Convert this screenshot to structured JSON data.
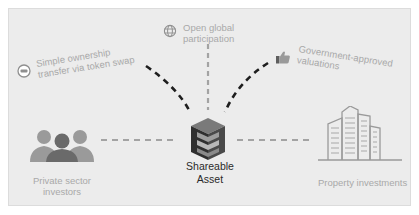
{
  "diagram": {
    "center": {
      "icon": "cube-asset-icon",
      "line1": "Shareable",
      "line2": "Asset"
    },
    "benefits": [
      {
        "icon": "token-swap-icon",
        "line1": "Simple ownership",
        "line2": "transfer via token swap"
      },
      {
        "icon": "globe-icon",
        "line1": "Open global",
        "line2": "participation"
      },
      {
        "icon": "thumbs-up-icon",
        "line1": "Government-approved",
        "line2": "valuations"
      }
    ],
    "left_node": {
      "icon": "people-group-icon",
      "line1": "Private sector",
      "line2": "investors"
    },
    "right_node": {
      "icon": "buildings-icon",
      "line1": "Property investments"
    },
    "colors": {
      "panel_bg": "#ececec",
      "label_text": "#a9a9a9",
      "center_text": "#2a2a2a",
      "dark_dash": "#1e1e1e",
      "light_dash": "#a3a3a3",
      "icon_gray": "#8f8f8f",
      "icon_dark": "#5e5e5e"
    }
  }
}
